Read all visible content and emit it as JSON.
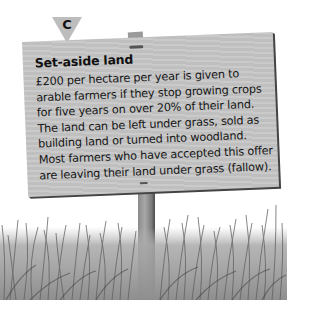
{
  "marker": {
    "label": "C",
    "color": "#bdbdbd"
  },
  "sign": {
    "title": "Set-aside land",
    "lines": [
      "£200 per hectare per year is given to",
      "arable farmers if they stop growing crops",
      "for five years on over 20% of their land.",
      "The land can be left under grass, sold as",
      "building land or turned into woodland.",
      "Most farmers who have accepted this offer",
      "are leaving their land under grass (fallow)."
    ],
    "color": "#c7c7c7"
  },
  "scene": {
    "grass_color": "#8c8c8c",
    "post_color": "#8a8a8a"
  }
}
